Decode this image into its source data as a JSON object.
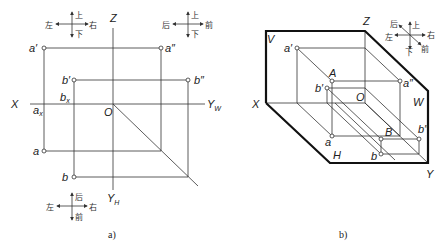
{
  "figure_a": {
    "caption": "a)",
    "axes": {
      "z": "Z",
      "x": "X",
      "o": "O",
      "yw": "Y",
      "yw_sub": "W",
      "yh": "Y",
      "yh_sub": "H"
    },
    "points": {
      "a_prime": "a′",
      "a_double_prime": "a″",
      "b_prime": "b′",
      "b_double_prime": "b″",
      "a": "a",
      "b": "b",
      "ax": "a",
      "ax_sub": "x",
      "bx": "b",
      "bx_sub": "x"
    },
    "compass_v": {
      "up": "上",
      "down": "下",
      "left": "左",
      "right": "右"
    },
    "compass_w": {
      "up": "上",
      "down": "下",
      "left": "后",
      "right": "前"
    },
    "compass_h": {
      "up": "后",
      "down": "前",
      "left": "左",
      "right": "右"
    }
  },
  "figure_b": {
    "caption": "b)",
    "planes": {
      "v": "V",
      "w": "W",
      "h": "H"
    },
    "axes": {
      "z": "Z",
      "x": "X",
      "y": "Y",
      "o": "O"
    },
    "points": {
      "A": "A",
      "B": "B",
      "a_prime": "a′",
      "a_double_prime": "a″",
      "a": "a",
      "b_prime": "b′",
      "b_double_prime": "b″",
      "b": "b"
    },
    "compass": {
      "up": "上",
      "down": "下",
      "left": "左",
      "right": "右",
      "back": "后",
      "front": "前"
    }
  }
}
